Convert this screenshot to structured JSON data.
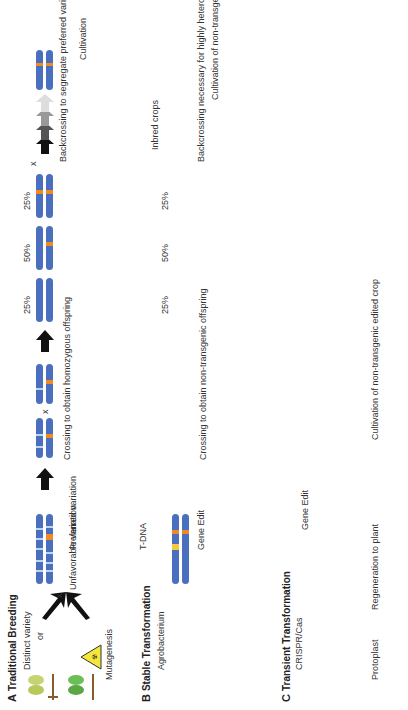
{
  "panels": {
    "A": {
      "letter": "A",
      "title": "Traditional Breeding",
      "distinct_variety": "Distinct variety",
      "or": "or",
      "mutagenesis": "Mutagenesis",
      "cross": "x",
      "unfavorable": "Unfavorable variation",
      "preferred": "Preferred variation",
      "crossing": "Crossing to obtain homozygous offspring",
      "pct": [
        "25%",
        "50%",
        "25%"
      ],
      "backcross": "Backcrossing to segregate preferred variation",
      "cultivation": "Cultivation"
    },
    "B": {
      "letter": "B",
      "title": "Stable Transformation",
      "agrobacterium": "Agrobacterium",
      "tdna": "T-DNA",
      "gene_edit": "Gene Edit",
      "cross": "x",
      "crossing": "Crossing to obtain non-transgenic offspring",
      "pct": [
        "25%",
        "50%",
        "25%"
      ],
      "inbred": "Inbred crops",
      "or": "or",
      "backcross": "Backcrossing necessary for highly heterozygous or outcrossing crops",
      "cultivation": "Cultivation of non-transgenic edited crop"
    },
    "C": {
      "letter": "C",
      "title": "Transient Transformation",
      "crispr": "CRISPR/Cas",
      "protoplast": "Protoplast",
      "regeneration": "Regeneration to plant",
      "gene_edit": "Gene Edit",
      "cultivation": "Cultivation of non-transgenic edited crop"
    }
  },
  "colors": {
    "chromosome": "#4a6fbf",
    "light_band": "#bfd6f0",
    "edit": "#f08a24",
    "tdna": "#f5c842",
    "stem": "#8b5a2b",
    "leaf": "#5aa845"
  }
}
